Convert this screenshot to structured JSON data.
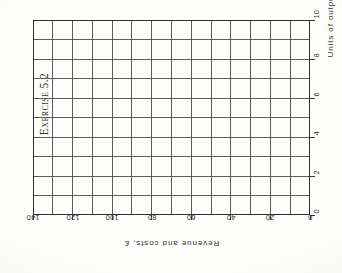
{
  "page": {
    "background_color": "#fdfdfc",
    "ink_color": "#2b2b2b"
  },
  "title": {
    "text": "Exercise 5.2"
  },
  "chart_data": {
    "type": "table",
    "title": "Exercise 5.2",
    "xlabel": "Units of output",
    "ylabel": "Revenue and costs, £",
    "xlim": [
      0,
      10
    ],
    "ylim": [
      0,
      140
    ],
    "grid": true,
    "grid_columns": 14,
    "grid_rows": 10,
    "xticks": [
      0,
      2,
      4,
      6,
      8,
      10
    ],
    "xtick_labels": [
      "0",
      "2",
      "4",
      "6",
      "8",
      "10"
    ],
    "yticks": [
      0,
      20,
      40,
      60,
      80,
      100,
      120,
      140
    ],
    "ytick_labels": [
      "0",
      "20",
      "40",
      "60",
      "80",
      "100",
      "120",
      "140"
    ],
    "series": [],
    "legend": null,
    "orientation_note": "page scanned rotated 90 degrees counter-clockwise",
    "grid_line_color": "#4a4a4a",
    "grid_border_color": "#2f2f2f"
  }
}
